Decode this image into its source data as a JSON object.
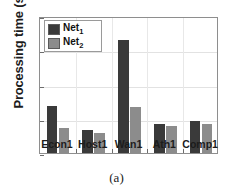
{
  "chart_data": {
    "type": "bar",
    "title": "",
    "xlabel": "",
    "ylabel": "Processing time (s)",
    "categories": [
      "Econ1",
      "Host1",
      "Wan1",
      "Ath1",
      "Comp1"
    ],
    "series": [
      {
        "name": "Net1",
        "label_base": "Net",
        "label_sub": "1",
        "color": "#3a3a3a",
        "values": [
          0.68,
          0.34,
          1.65,
          0.43,
          0.47
        ]
      },
      {
        "name": "Net2",
        "label_base": "Net",
        "label_sub": "2",
        "color": "#8c8c8c",
        "values": [
          0.37,
          0.29,
          0.67,
          0.39,
          0.43
        ]
      }
    ],
    "ylim": [
      0,
      2
    ],
    "yticks": [
      0,
      0.5,
      1,
      1.5,
      2
    ],
    "ytick_labels": [
      "0",
      "0.5",
      "1",
      "1.5",
      "2"
    ],
    "grid": true,
    "legend_position": "upper-left"
  },
  "caption": "(a)"
}
